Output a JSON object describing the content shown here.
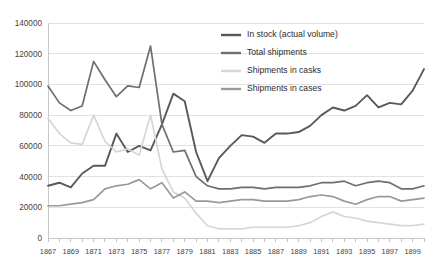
{
  "chart_data": {
    "type": "line",
    "title": "",
    "xlabel": "",
    "ylabel": "",
    "grid": true,
    "legend_position": "top-right",
    "xlim": [
      1867,
      1900
    ],
    "ylim": [
      0,
      140000
    ],
    "y_ticks": [
      0,
      20000,
      40000,
      60000,
      80000,
      100000,
      120000,
      140000
    ],
    "y_tick_labels": [
      "0",
      "20000",
      "40000",
      "60000",
      "80000",
      "100000",
      "120000",
      "140000"
    ],
    "x": [
      1867,
      1868,
      1869,
      1870,
      1871,
      1872,
      1873,
      1874,
      1875,
      1876,
      1877,
      1878,
      1879,
      1880,
      1881,
      1882,
      1883,
      1884,
      1885,
      1886,
      1887,
      1888,
      1889,
      1890,
      1891,
      1892,
      1893,
      1894,
      1895,
      1896,
      1897,
      1898,
      1899,
      1900
    ],
    "x_tick_labels": [
      "1867",
      "1869",
      "1871",
      "1873",
      "1875",
      "1877",
      "1879",
      "1881",
      "1883",
      "1885",
      "1887",
      "1889",
      "1891",
      "1893",
      "1895",
      "1897",
      "1899"
    ],
    "x_tick_values": [
      1867,
      1869,
      1871,
      1873,
      1875,
      1877,
      1879,
      1881,
      1883,
      1885,
      1887,
      1889,
      1891,
      1893,
      1895,
      1897,
      1899
    ],
    "series": [
      {
        "name": "In stock (actual volume)",
        "color": "#595959",
        "width": 1.9,
        "values": [
          34000,
          36000,
          33000,
          42000,
          47000,
          47000,
          68000,
          56000,
          60000,
          57000,
          74000,
          94000,
          89000,
          56000,
          37000,
          52000,
          60000,
          67000,
          66000,
          62000,
          68000,
          68000,
          69000,
          73000,
          80000,
          85000,
          83000,
          86000,
          93000,
          85000,
          88000,
          87000,
          96000,
          110000
        ]
      },
      {
        "name": "Total shipments",
        "color": "#6e6e6e",
        "width": 1.7,
        "values": [
          99000,
          88000,
          83000,
          86000,
          115000,
          103000,
          92000,
          99000,
          98000,
          125000,
          74000,
          56000,
          57000,
          40000,
          34000,
          32000,
          32000,
          33000,
          33000,
          32000,
          33000,
          33000,
          33000,
          34000,
          36000,
          36000,
          37000,
          34000,
          36000,
          37000,
          36000,
          32000,
          32000,
          34000
        ]
      },
      {
        "name": "Shipments in casks",
        "color": "#d6d6d6",
        "width": 1.7,
        "values": [
          78000,
          68000,
          62000,
          61000,
          80000,
          63000,
          56000,
          58000,
          54000,
          80000,
          45000,
          30000,
          26000,
          16000,
          8000,
          6000,
          6000,
          6000,
          7000,
          7000,
          7000,
          7000,
          8000,
          10000,
          14000,
          17000,
          14000,
          13000,
          11000,
          10000,
          9000,
          8000,
          8000,
          9000
        ]
      },
      {
        "name": "Shipments in cases",
        "color": "#999999",
        "width": 1.7,
        "values": [
          21000,
          21000,
          22000,
          23000,
          25000,
          32000,
          34000,
          35000,
          38000,
          32000,
          36000,
          26000,
          30000,
          24000,
          24000,
          23000,
          24000,
          25000,
          25000,
          24000,
          24000,
          24000,
          25000,
          27000,
          28000,
          27000,
          24000,
          22000,
          25000,
          27000,
          27000,
          24000,
          25000,
          26000
        ]
      }
    ],
    "legend": [
      {
        "label": "In stock (actual volume)",
        "color": "#595959"
      },
      {
        "label": "Total shipments",
        "color": "#6e6e6e"
      },
      {
        "label": "Shipments in casks",
        "color": "#d6d6d6"
      },
      {
        "label": "Shipments in cases",
        "color": "#999999"
      }
    ]
  }
}
